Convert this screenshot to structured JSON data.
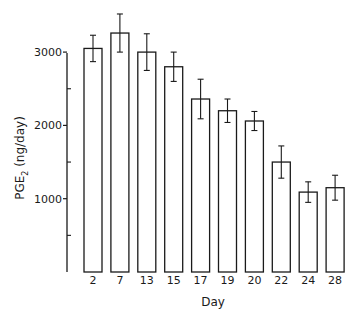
{
  "chart_data": {
    "type": "bar",
    "title": "",
    "xlabel": "Day",
    "ylabel": "PGE₂ (ng/day)",
    "ylabel_main": "PGE",
    "ylabel_sub": "2",
    "ylabel_units": " (ng/day)",
    "categories": [
      "2",
      "7",
      "13",
      "15",
      "17",
      "19",
      "20",
      "22",
      "24",
      "28"
    ],
    "values": [
      3050,
      3260,
      3000,
      2800,
      2360,
      2200,
      2060,
      1500,
      1090,
      1150
    ],
    "error": [
      180,
      260,
      250,
      200,
      270,
      160,
      130,
      220,
      140,
      170
    ],
    "ylim": [
      0,
      3000
    ],
    "yticks_major": [
      1000,
      2000,
      3000
    ],
    "yticks_major_labels": [
      "1000",
      "2000",
      "3000"
    ],
    "yticks_minor": [
      500,
      1500,
      2500
    ],
    "grid": false,
    "legend": null,
    "bar_fill": "#ffffff",
    "bar_stroke": "#1a1a1a",
    "error_bars": true
  }
}
